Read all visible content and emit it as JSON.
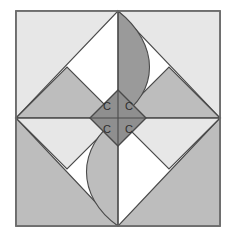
{
  "figure": {
    "name": "quilt-block-pinwheel-with-arcs",
    "width": 235,
    "height": 239,
    "background": "#ffffff"
  },
  "palette": {
    "white": "#ffffff",
    "light_gray": "#e7e7e7",
    "mid_light_gray": "#cfcfcf",
    "mid_gray": "#bdbdbd",
    "dark_gray": "#8f8f8f",
    "center_gray": "#9a9a9a",
    "outline": "#4a4a4a",
    "border": "#6e6e6e",
    "letter_color": "#2e2e2e"
  },
  "frame": {
    "label": "outer-square-frame",
    "x": 16,
    "y": 11,
    "width": 204,
    "height": 215,
    "stroke": "#6e6e6e",
    "fill": "#ffffff"
  },
  "corner_triangles": [
    {
      "name": "corner-triangle-top-left",
      "fill": "#e7e7e7",
      "points": "16,11 118,11 16,118"
    },
    {
      "name": "corner-triangle-top-right",
      "fill": "#e7e7e7",
      "points": "220,11 220,118 118,11"
    },
    {
      "name": "corner-triangle-bottom-left",
      "fill": "#bdbdbd",
      "points": "16,226 16,118 118,226"
    },
    {
      "name": "corner-triangle-bottom-right",
      "fill": "#bdbdbd",
      "points": "220,226 118,226 220,118"
    }
  ],
  "inner_diamonds": [
    {
      "name": "left-diamond-upper",
      "fill": "#bdbdbd",
      "points": "16,118 67,67 118,118"
    },
    {
      "name": "left-diamond-lower",
      "fill": "#e7e7e7",
      "points": "16,118 118,118 67,169"
    },
    {
      "name": "right-diamond-upper",
      "fill": "#bdbdbd",
      "points": "118,118 169,67 220,118"
    },
    {
      "name": "right-diamond-lower",
      "fill": "#e7e7e7",
      "points": "118,118 220,118 169,169"
    }
  ],
  "petals": [
    {
      "name": "petal-top-arc",
      "fill": "#9a9a9a",
      "path": "M 118 11 L 118 118 L 118 118 C 160 92 160 44 118 11 Z"
    },
    {
      "name": "petal-bottom-arc",
      "fill": "#bdbdbd",
      "path": "M 118 226 L 118 118 C 76 148 76 196 118 226 Z"
    }
  ],
  "center": {
    "name": "center-diamond",
    "fill": "#8f8f8f",
    "points": "118,90 146,118 118,146 90,118",
    "divider_vertical": {
      "x1": 118,
      "y1": 90,
      "x2": 118,
      "y2": 146
    },
    "divider_horizontal": {
      "x1": 90,
      "y1": 118,
      "x2": 146,
      "y2": 118
    },
    "letters": [
      {
        "name": "center-letter-top-left",
        "text": "C",
        "x": 107,
        "y": 107
      },
      {
        "name": "center-letter-top-right",
        "text": "C",
        "x": 129,
        "y": 107
      },
      {
        "name": "center-letter-bottom-left",
        "text": "C",
        "x": 107,
        "y": 130
      },
      {
        "name": "center-letter-bottom-right",
        "text": "C",
        "x": 129,
        "y": 130
      }
    ]
  },
  "axes": {
    "horizontal_center": {
      "name": "center-line-horizontal",
      "x1": 16,
      "y1": 118,
      "x2": 220,
      "y2": 118
    },
    "vertical_center": {
      "name": "center-line-vertical",
      "x1": 118,
      "y1": 11,
      "x2": 118,
      "y2": 226
    }
  }
}
